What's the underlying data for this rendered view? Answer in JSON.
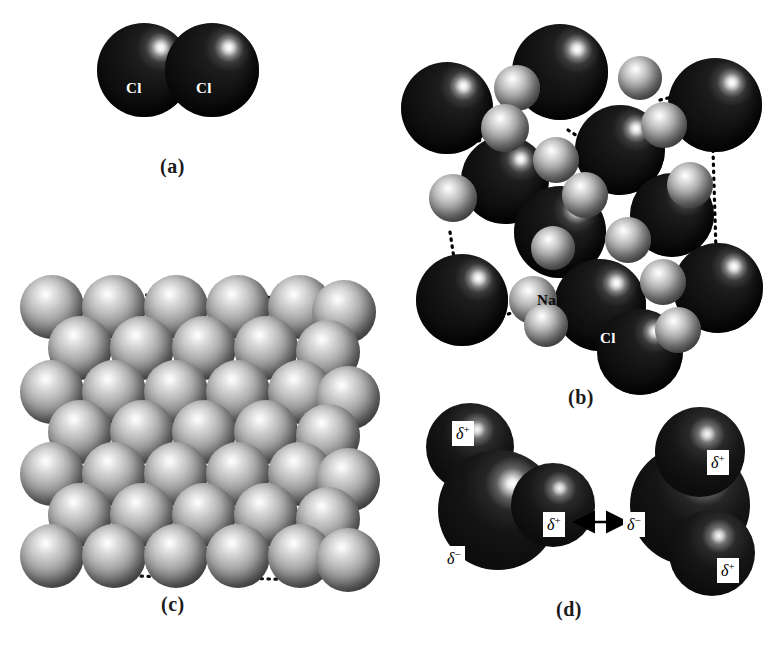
{
  "figure": {
    "background_color": "#ffffff",
    "width": 781,
    "height": 650
  },
  "colors": {
    "chlorine_sphere": "#141414",
    "sodium_sphere": "#a3a3a3",
    "metal_sphere": "#a3a3a3",
    "dotted_line": "#000000",
    "label_on_dark": "#ffffff",
    "label_on_light": "#0b0b0b",
    "caption": "#1a1a1a"
  },
  "panels": [
    {
      "id": "a",
      "caption": "(a)",
      "description": "Covalent bonding: chlorine molecule Cl2, two identical dark spheres in contact",
      "atom_labels": [
        "Cl",
        "Cl"
      ],
      "atoms": [
        {
          "element": "Cl",
          "cx": 144,
          "cy": 70,
          "r": 47,
          "shade": "dark",
          "label": "Cl",
          "label_dx": -13,
          "label_dy": 18
        },
        {
          "element": "Cl",
          "cx": 212,
          "cy": 70,
          "r": 47,
          "shade": "dark",
          "label": "Cl",
          "label_dx": -13,
          "label_dy": 18
        }
      ],
      "caption_x": 160,
      "caption_y": 155
    },
    {
      "id": "b",
      "caption": "(b)",
      "description": "Ionic bonding: sodium chloride lattice of large Cl ions and small Na ions joined by dotted unit-cell lines",
      "atom_labels": [
        "Na",
        "Cl"
      ],
      "caption_x": 568,
      "caption_y": 386
    },
    {
      "id": "c",
      "caption": "(c)",
      "description": "Metallic bonding: close-packed array of identical metal atoms with dotted unit-cell lines",
      "caption_x": 161,
      "caption_y": 593
    },
    {
      "id": "d",
      "caption": "(d)",
      "description": "Hydrogen bonding between two water molecules; partial charges marked and attraction shown by a double-headed arrow",
      "charge_labels": [
        "δ+",
        "δ−"
      ],
      "caption_x": 556,
      "caption_y": 598
    }
  ],
  "panel_a": {
    "atoms": [
      {
        "label": "Cl",
        "cx": 144,
        "cy": 70,
        "r": 47
      },
      {
        "label": "Cl",
        "cx": 212,
        "cy": 70,
        "r": 47
      }
    ]
  },
  "panel_b": {
    "label_na": "Na",
    "label_cl": "Cl",
    "na_label_pos": {
      "x": 544,
      "y": 300
    },
    "cl_label_pos": {
      "x": 607,
      "y": 339
    },
    "cl_atoms": [
      {
        "cx": 447,
        "cy": 108,
        "r": 46
      },
      {
        "cx": 560,
        "cy": 72,
        "r": 48
      },
      {
        "cx": 715,
        "cy": 105,
        "r": 47
      },
      {
        "cx": 505,
        "cy": 180,
        "r": 44
      },
      {
        "cx": 620,
        "cy": 150,
        "r": 45
      },
      {
        "cx": 560,
        "cy": 232,
        "r": 46
      },
      {
        "cx": 672,
        "cy": 215,
        "r": 42
      },
      {
        "cx": 462,
        "cy": 300,
        "r": 46
      },
      {
        "cx": 600,
        "cy": 305,
        "r": 46
      },
      {
        "cx": 718,
        "cy": 288,
        "r": 45
      },
      {
        "cx": 640,
        "cy": 352,
        "r": 43
      }
    ],
    "na_atoms": [
      {
        "cx": 517,
        "cy": 88,
        "r": 23
      },
      {
        "cx": 640,
        "cy": 78,
        "r": 22
      },
      {
        "cx": 505,
        "cy": 128,
        "r": 24
      },
      {
        "cx": 664,
        "cy": 125,
        "r": 23
      },
      {
        "cx": 556,
        "cy": 160,
        "r": 23
      },
      {
        "cx": 585,
        "cy": 195,
        "r": 23
      },
      {
        "cx": 453,
        "cy": 198,
        "r": 24
      },
      {
        "cx": 690,
        "cy": 185,
        "r": 23
      },
      {
        "cx": 553,
        "cy": 248,
        "r": 22
      },
      {
        "cx": 628,
        "cy": 240,
        "r": 23
      },
      {
        "cx": 533,
        "cy": 300,
        "r": 24
      },
      {
        "cx": 663,
        "cy": 282,
        "r": 23
      },
      {
        "cx": 546,
        "cy": 325,
        "r": 22
      },
      {
        "cx": 678,
        "cy": 330,
        "r": 23
      }
    ],
    "dotted_links": [
      [
        505,
        128,
        460,
        150
      ],
      [
        660,
        100,
        700,
        90
      ],
      [
        713,
        150,
        716,
        250
      ],
      [
        450,
        232,
        455,
        265
      ],
      [
        462,
        330,
        520,
        310
      ],
      [
        676,
        300,
        700,
        300
      ],
      [
        690,
        205,
        700,
        250
      ],
      [
        632,
        345,
        668,
        335
      ]
    ]
  },
  "panel_c": {
    "rows": [
      {
        "y": 307,
        "x_start": 52,
        "x_step": 62,
        "count": 6,
        "r": 32
      },
      {
        "y": 348,
        "x_start": 80,
        "x_step": 62,
        "count": 5,
        "r": 32
      },
      {
        "y": 392,
        "x_start": 52,
        "x_step": 62,
        "count": 6,
        "r": 32
      },
      {
        "y": 432,
        "x_start": 80,
        "x_step": 62,
        "count": 5,
        "r": 32
      },
      {
        "y": 474,
        "x_start": 52,
        "x_step": 62,
        "count": 6,
        "r": 32
      },
      {
        "y": 515,
        "x_start": 80,
        "x_step": 62,
        "count": 5,
        "r": 32
      },
      {
        "y": 556,
        "x_start": 52,
        "x_step": 62,
        "count": 6,
        "r": 32
      }
    ],
    "dotted_links": [
      [
        52,
        330,
        52,
        455
      ],
      [
        52,
        455,
        52,
        560
      ],
      [
        112,
        290,
        180,
        300
      ],
      [
        240,
        295,
        300,
        300
      ],
      [
        300,
        300,
        345,
        312
      ],
      [
        90,
        360,
        120,
        400
      ],
      [
        150,
        408,
        200,
        415
      ],
      [
        250,
        412,
        300,
        418
      ],
      [
        330,
        420,
        350,
        430
      ],
      [
        85,
        445,
        110,
        485
      ],
      [
        145,
        492,
        200,
        498
      ],
      [
        250,
        495,
        300,
        500
      ],
      [
        330,
        505,
        350,
        512
      ],
      [
        338,
        300,
        338,
        420
      ],
      [
        338,
        420,
        338,
        540
      ],
      [
        120,
        575,
        180,
        578
      ],
      [
        240,
        578,
        300,
        580
      ]
    ]
  },
  "panel_d": {
    "molecule_left": {
      "oxygen": {
        "cx": 498,
        "cy": 510,
        "r": 60
      },
      "hydrogens": [
        {
          "cx": 470,
          "cy": 447,
          "r": 44
        },
        {
          "cx": 553,
          "cy": 505,
          "r": 42
        }
      ],
      "charges": [
        {
          "text_symbol": "δ",
          "text_sign": "+",
          "x": 452,
          "y": 421
        },
        {
          "text_symbol": "δ",
          "text_sign": "+",
          "x": 543,
          "y": 512
        },
        {
          "text_symbol": "δ",
          "text_sign": "−",
          "x": 443,
          "y": 546
        }
      ]
    },
    "molecule_right": {
      "oxygen": {
        "cx": 690,
        "cy": 505,
        "r": 60
      },
      "hydrogens": [
        {
          "cx": 700,
          "cy": 452,
          "r": 45
        },
        {
          "cx": 712,
          "cy": 553,
          "r": 43
        }
      ],
      "charges": [
        {
          "text_symbol": "δ",
          "text_sign": "+",
          "x": 707,
          "y": 450
        },
        {
          "text_symbol": "δ",
          "text_sign": "−",
          "x": 623,
          "y": 512
        },
        {
          "text_symbol": "δ",
          "text_sign": "+",
          "x": 717,
          "y": 558
        }
      ]
    },
    "arrow": {
      "x1": 574,
      "y1": 522,
      "x2": 621,
      "y2": 522
    }
  }
}
